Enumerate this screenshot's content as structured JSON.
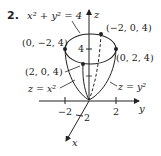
{
  "problem": {
    "number": "2.",
    "equation": "x² + y² = 4"
  },
  "axes": {
    "z_label": "z",
    "y_label": "y",
    "x_label": "x",
    "z_tick": "4",
    "y_ticks": [
      "−2",
      "2"
    ],
    "x_tick": "2"
  },
  "points": {
    "top": "(−2, 0, 4)",
    "left": "(0, −2, 4)",
    "right": "(0, 2, 4)",
    "front": "(2, 0, 4)"
  },
  "curves": {
    "xz": "z = x²",
    "yz": "z = y²"
  },
  "colors": {
    "ink": "#222222",
    "background": "#ffffff"
  }
}
